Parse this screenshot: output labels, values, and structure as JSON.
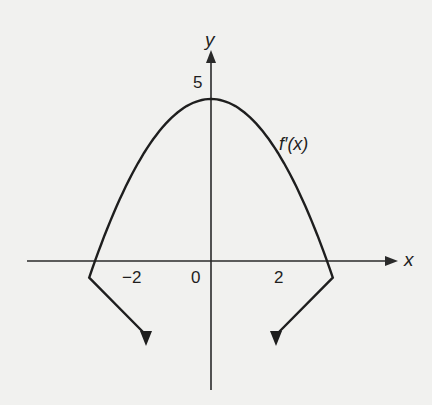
{
  "chart_data": {
    "type": "line",
    "title": "",
    "series": [
      {
        "name": "f'(x)",
        "equation": "y = 5 - 1.25x^2",
        "x": [
          -2.1,
          -2,
          -1.5,
          -1,
          -0.5,
          0,
          0.5,
          1,
          1.5,
          2,
          2.1
        ],
        "y": [
          -0.51,
          0,
          2.19,
          3.75,
          4.69,
          5,
          4.69,
          3.75,
          2.19,
          0,
          -0.51
        ],
        "arrows_at_ends": true
      }
    ],
    "xlabel": "x",
    "ylabel": "y",
    "x_tick_labels": [
      "-2",
      "0",
      "2"
    ],
    "x_ticks": [
      -2,
      0,
      2
    ],
    "y_tick_labels": [
      "5"
    ],
    "y_ticks": [
      5
    ],
    "annotations": [
      "f'(x)"
    ],
    "grid": false,
    "legend": "none",
    "colors": {
      "curve": "#1e1e1e",
      "axes": "#2a2a2a",
      "background": "#f1f1ef"
    }
  },
  "labels": {
    "y_axis": "y",
    "x_axis": "x",
    "y_max": "5",
    "origin": "0",
    "x_neg2": "−2",
    "x_pos2": "2",
    "curve_name": "f′(x)"
  }
}
